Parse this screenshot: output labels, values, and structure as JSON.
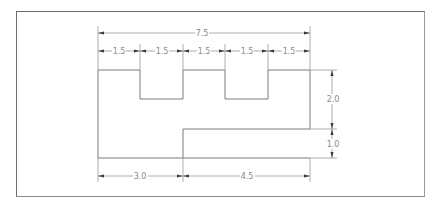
{
  "drawing": {
    "title": "Dimensioned part outline",
    "units_label": "",
    "overall_width": "7.5",
    "top_segments": [
      "1.5",
      "1.5",
      "1.5",
      "1.5",
      "1.5"
    ],
    "right_heights": [
      "2.0",
      "1.0"
    ],
    "bottom_segments": [
      "3.0",
      "4.5"
    ]
  },
  "colors": {
    "outline": "#7a7a7a",
    "dimension_line": "#9a9a9a",
    "arrowhead": "#3a3a3a",
    "label": "#8a8a8a",
    "frame": "#6e6e6e",
    "background": "#ffffff"
  }
}
